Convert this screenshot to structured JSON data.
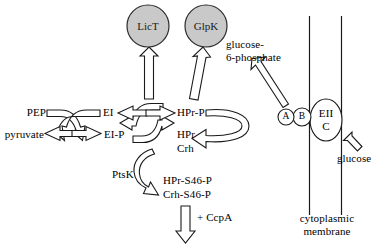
{
  "figure": {
    "type": "pathway-diagram",
    "title": "",
    "background_color": "#ffffff",
    "node_fill_color": "#c9c9c9",
    "line_color": "#1a1a1a",
    "width": 379,
    "height": 246
  },
  "regulator_nodes": [
    {
      "id": "lict",
      "label": "LicT"
    },
    {
      "id": "glpk",
      "label": "GlpK"
    }
  ],
  "pts_cascade": {
    "pep": "PEP",
    "pyruvate": "pyruvate",
    "ei": "EI",
    "ei_p": "EI-P",
    "hpr_p": "HPr-P",
    "hpr": "HPr",
    "crh": "Crh"
  },
  "kinase": {
    "label": "PtsK"
  },
  "seryl_products": {
    "hpr_s46_p": "HPr-S46-P",
    "crh_s46_p": "Crh-S46-P"
  },
  "corepressor": {
    "label": "+ CcpA"
  },
  "transport": {
    "eiia": "A",
    "eiib": "B",
    "eiic_line1": "EII",
    "eiic_line2": "C",
    "glucose": "glucose",
    "product_line1": "glucose-",
    "product_line2": "6-phosphate",
    "membrane_line1": "cytoplasmic",
    "membrane_line2": "membrane"
  }
}
